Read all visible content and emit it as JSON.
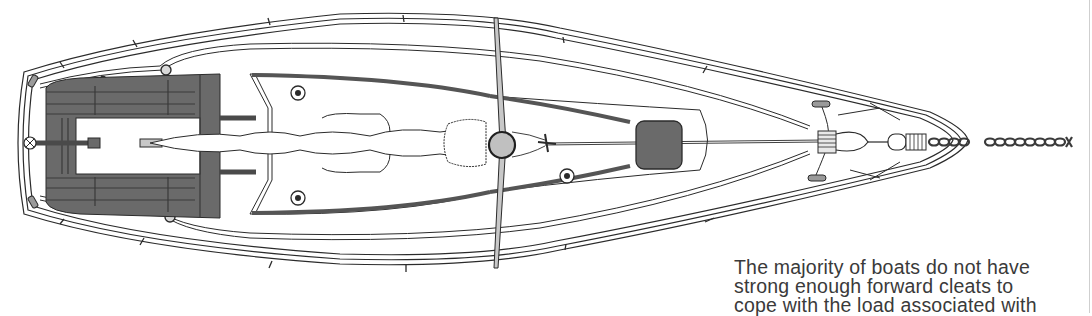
{
  "figure": {
    "colors": {
      "line": "#2b2b2b",
      "fill_dark": "#6a6a6a",
      "fill_mid": "#bdbdbd",
      "fill_light": "#d8d8d8",
      "background": "#ffffff"
    },
    "labels": {
      "hull": "hull-outline",
      "cockpit": "cockpit",
      "mast": "mast",
      "hatch": "fore-hatch",
      "cleats": "forward-cleats",
      "chain": "anchor-chain"
    }
  },
  "caption": {
    "lines": [
      "The majority of boats do not have",
      "strong enough forward cleats to",
      "cope with the load associated with"
    ]
  }
}
